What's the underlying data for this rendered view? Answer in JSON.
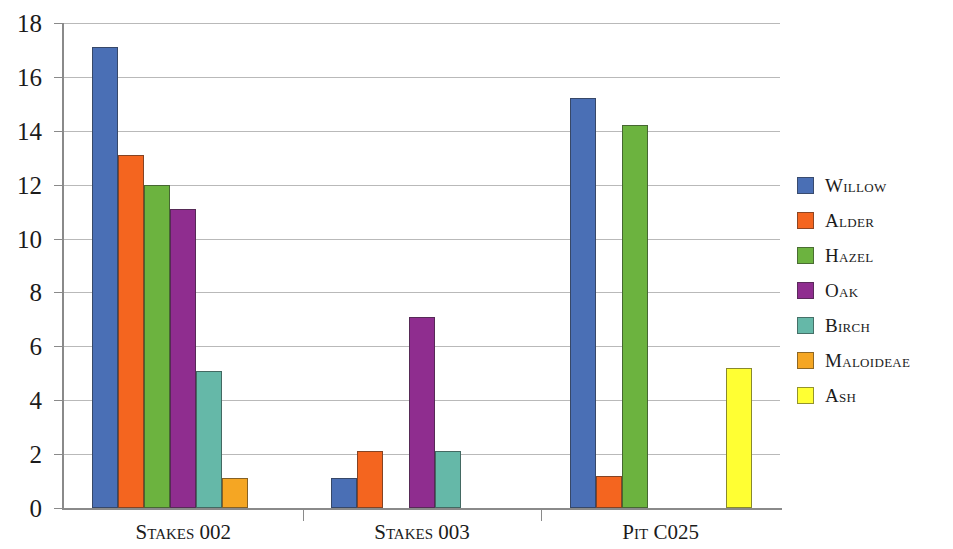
{
  "chart_data": {
    "type": "bar",
    "title": "",
    "xlabel": "",
    "ylabel": "",
    "ylim": [
      0,
      18
    ],
    "ytick_step": 2,
    "yticks": [
      "18",
      "16",
      "14",
      "12",
      "10",
      "8",
      "6",
      "4",
      "2",
      "0"
    ],
    "grid": true,
    "legend_position": "right",
    "categories": [
      "Stakes 002",
      "Stakes 003",
      "Pit C025"
    ],
    "series": [
      {
        "name": "Willow",
        "color": "#4a6fb5",
        "values": [
          17.1,
          1.1,
          15.2
        ]
      },
      {
        "name": "Alder",
        "color": "#f4651f",
        "values": [
          13.1,
          2.1,
          1.2
        ]
      },
      {
        "name": "Hazel",
        "color": "#6cb33f",
        "values": [
          12.0,
          0,
          14.2
        ]
      },
      {
        "name": "Oak",
        "color": "#8f2d8f",
        "values": [
          11.1,
          7.1,
          0
        ]
      },
      {
        "name": "Birch",
        "color": "#65b8a8",
        "values": [
          5.1,
          2.1,
          0
        ]
      },
      {
        "name": "Maloideae",
        "color": "#f5a623",
        "values": [
          1.1,
          0,
          0
        ]
      },
      {
        "name": "Ash",
        "color": "#ffff33",
        "values": [
          0,
          0,
          5.2
        ]
      }
    ]
  }
}
